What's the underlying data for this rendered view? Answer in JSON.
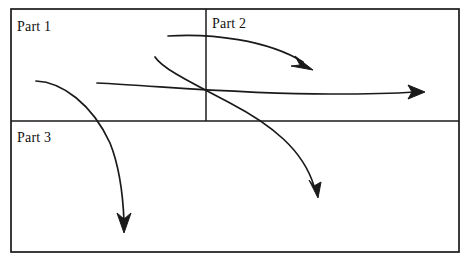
{
  "diagram": {
    "background_color": "#ffffff",
    "stroke_color": "#1a1a1a",
    "regions": [
      {
        "id": "part-1",
        "label": "Part 1",
        "x": 11,
        "y": 9,
        "width": 195,
        "height": 112
      },
      {
        "id": "part-2",
        "label": "Part 2",
        "x": 206,
        "y": 9,
        "width": 253,
        "height": 112
      },
      {
        "id": "part-3",
        "label": "Part 3",
        "x": 11,
        "y": 121,
        "width": 448,
        "height": 131
      }
    ],
    "frame": {
      "x": 11,
      "y": 9,
      "width": 448,
      "height": 243,
      "stroke_width": 1.6
    },
    "dividers": [
      {
        "id": "horizontal-divider",
        "x1": 11,
        "y1": 121,
        "x2": 459,
        "y2": 121
      },
      {
        "id": "vertical-divider",
        "x1": 206,
        "y1": 9,
        "x2": 206,
        "y2": 121
      }
    ],
    "arrows": [
      {
        "id": "arrow-part1-to-part2",
        "from_region": "part-1",
        "to_region": "part-2",
        "start": [
          168,
          36
        ],
        "end": [
          313,
          70
        ],
        "head_angle_deg": 58
      },
      {
        "id": "arrow-part1-through-part2-out",
        "from_region": "part-1",
        "to_region": "part-2",
        "start": [
          97,
          83
        ],
        "end": [
          425,
          92
        ],
        "head_angle_deg": 3
      },
      {
        "id": "arrow-part1-to-part3-right",
        "from_region": "part-1",
        "to_region": "part-3",
        "start": [
          155,
          57
        ],
        "end": [
          318,
          198
        ],
        "head_angle_deg": 82
      },
      {
        "id": "arrow-part1-to-part3-left",
        "from_region": "part-1",
        "to_region": "part-3",
        "start": [
          36,
          81
        ],
        "end": [
          124,
          233
        ],
        "head_angle_deg": 90
      }
    ]
  }
}
